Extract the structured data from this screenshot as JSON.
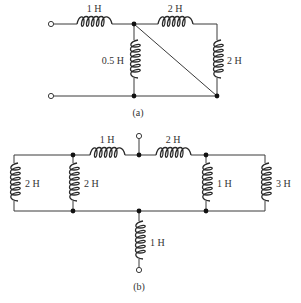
{
  "diagram_a": {
    "caption": "(a)",
    "inductors": {
      "series_left": "1 H",
      "series_top_right": "2 H",
      "shunt_middle": "0.5 H",
      "shunt_right": "2 H"
    }
  },
  "diagram_b": {
    "caption": "(b)",
    "inductors": {
      "far_left": "2 H",
      "left_shunt": "2 H",
      "top_left_series": "1 H",
      "top_right_series": "2 H",
      "right_shunt": "1 H",
      "far_right": "3 H",
      "bottom_leg": "1 H"
    }
  }
}
